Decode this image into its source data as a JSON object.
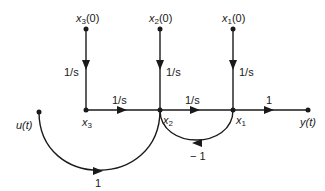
{
  "diagram": {
    "type": "signal-flow-graph",
    "nodes": {
      "x3_init": {
        "label": "x3(0)",
        "base": "x",
        "sub": "3",
        "suffix": "(0)"
      },
      "x2_init": {
        "label": "x2(0)",
        "base": "x",
        "sub": "2",
        "suffix": "(0)"
      },
      "x1_init": {
        "label": "x1(0)",
        "base": "x",
        "sub": "1",
        "suffix": "(0)"
      },
      "x3": {
        "label": "x3",
        "base": "x",
        "sub": "3"
      },
      "x2": {
        "label": "x2",
        "base": "x",
        "sub": "2"
      },
      "x1": {
        "label": "x1",
        "base": "x",
        "sub": "1"
      },
      "u": {
        "label": "u(t)"
      },
      "y": {
        "label": "y(t)"
      }
    },
    "edges": [
      {
        "from": "x3(0)",
        "to": "x3",
        "gain": "1/s"
      },
      {
        "from": "x2(0)",
        "to": "x2",
        "gain": "1/s"
      },
      {
        "from": "x1(0)",
        "to": "x1",
        "gain": "1/s"
      },
      {
        "from": "x3",
        "to": "x2",
        "gain": "1/s"
      },
      {
        "from": "x2",
        "to": "x1",
        "gain": "1/s"
      },
      {
        "from": "x1",
        "to": "y(t)",
        "gain": "1"
      },
      {
        "from": "x1",
        "to": "x2",
        "gain": "− 1"
      },
      {
        "from": "u(t)",
        "to": "x2",
        "gain": "1"
      }
    ]
  }
}
